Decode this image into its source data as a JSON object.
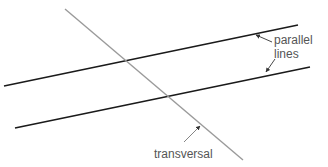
{
  "diagram": {
    "labels": {
      "parallel": [
        "parallel",
        "lines"
      ],
      "transversal": "transversal"
    },
    "colors": {
      "parallel_lines": "#1a1a1a",
      "transversal": "#9a9a9a",
      "label_text": "#555555",
      "arrow": "#333333"
    },
    "lines": {
      "parallel_upper": {
        "x1": 4,
        "y1": 86,
        "x2": 298,
        "y2": 25
      },
      "parallel_lower": {
        "x1": 15,
        "y1": 128,
        "x2": 310,
        "y2": 67
      },
      "transversal": {
        "x1": 65,
        "y1": 9,
        "x2": 243,
        "y2": 160
      }
    }
  }
}
